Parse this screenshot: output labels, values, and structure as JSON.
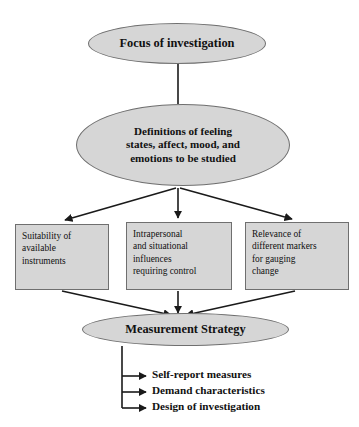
{
  "diagram": {
    "fill_color": "#d6d6d6",
    "stroke_color": "#6f6f6f",
    "line_color": "#1a1a1a",
    "background": "#ffffff"
  },
  "nodes": {
    "focus": {
      "label": "Focus of investigation",
      "shape": "ellipse"
    },
    "definitions": {
      "line1": "Definitions of feeling",
      "line2": "states, affect, mood, and",
      "line3": "emotions to be studied",
      "shape": "ellipse"
    },
    "suitability": {
      "line1": "Suitability of",
      "line2": "available",
      "line3": "instruments",
      "shape": "rectangle"
    },
    "intrapersonal": {
      "line1": "Intrapersonal",
      "line2": "and situational",
      "line3": "influences",
      "line4": "requiring control",
      "shape": "rectangle"
    },
    "relevance": {
      "line1": "Relevance of",
      "line2": "different markers",
      "line3": "for gauging",
      "line4": "change",
      "shape": "rectangle"
    },
    "strategy": {
      "label": "Measurement Strategy",
      "shape": "ellipse"
    }
  },
  "outcomes": [
    {
      "label": "Self-report measures"
    },
    {
      "label": "Demand characteristics"
    },
    {
      "label": "Design of investigation"
    }
  ]
}
